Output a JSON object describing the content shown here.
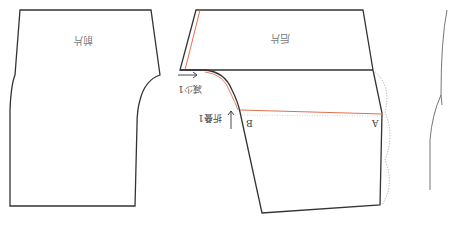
{
  "diagram": {
    "orientation": "rotated 180 degrees",
    "colors": {
      "outline": "#333333",
      "adjustment_line": "#e07050",
      "dotted": "#999999",
      "side_curve": "#777777"
    },
    "labels": {
      "front_piece": "前片",
      "back_piece": "后片",
      "reduce_note": "减少1",
      "fold_note": "折叠1",
      "point_a": "A",
      "point_b": "B"
    },
    "arrows": {
      "reduce_arrow": "→",
      "fold_arrow": "↑"
    }
  }
}
